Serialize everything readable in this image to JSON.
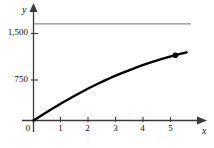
{
  "figure": {
    "background_color": "#ffffff",
    "axis_color": "#3a3a3a",
    "curve_color": "#000000",
    "asymptote_color": "#8d8d8d"
  },
  "chart_data": {
    "type": "line",
    "title": "",
    "subtitle": "",
    "xlabel": "x",
    "ylabel": "y",
    "xlim": [
      0,
      5.8
    ],
    "ylim": [
      0,
      1700
    ],
    "grid": false,
    "legend": null,
    "x_ticks": [
      0,
      1,
      2,
      3,
      4,
      5
    ],
    "x_tick_labels": [
      "0",
      "1",
      "2",
      "3",
      "4",
      "5"
    ],
    "y_ticks": [
      750,
      1500
    ],
    "y_tick_labels": [
      "750",
      "1,500"
    ],
    "origin_label": "0",
    "series": [
      {
        "name": "curve",
        "kind": "curve",
        "x": [
          0,
          0.25,
          0.5,
          0.75,
          1,
          1.25,
          1.5,
          1.75,
          2,
          2.25,
          2.5,
          2.75,
          3,
          3.25,
          3.5,
          3.75,
          4,
          4.25,
          4.5,
          4.75,
          5,
          5.25,
          5.4
        ],
        "y": [
          0,
          70,
          140,
          207,
          272,
          335,
          396,
          455,
          512,
          566,
          618,
          668,
          715,
          760,
          803,
          844,
          882,
          918,
          952,
          984,
          1014,
          1042,
          1058
        ]
      },
      {
        "name": "asymptote",
        "kind": "horizontal-line",
        "y": 1500,
        "x_start": 0,
        "x_end": 5.55
      }
    ],
    "markers": [
      {
        "name": "endpoint-dot",
        "x": 5,
        "y": 1014,
        "shape": "filled-circle"
      }
    ]
  }
}
